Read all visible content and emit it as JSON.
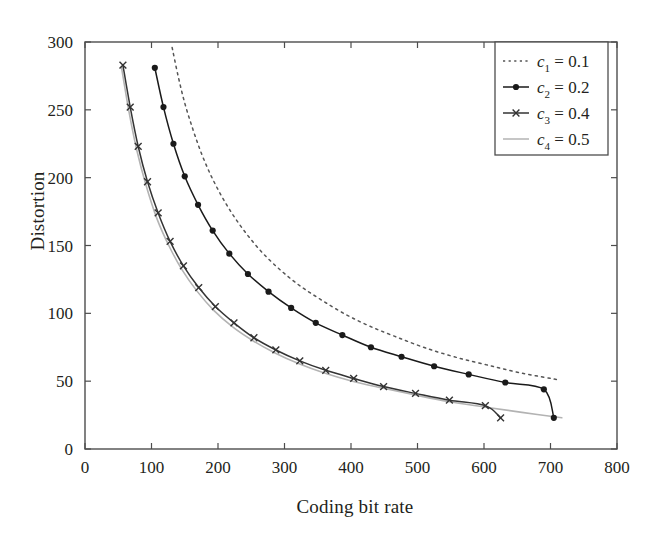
{
  "chart_data": {
    "type": "line",
    "title": "",
    "xlabel": "Coding bit rate",
    "ylabel": "Distortion",
    "xlim": [
      0,
      800
    ],
    "ylim": [
      0,
      300
    ],
    "xticks": [
      0,
      100,
      200,
      300,
      400,
      500,
      600,
      700,
      800
    ],
    "yticks": [
      0,
      50,
      100,
      150,
      200,
      250,
      300
    ],
    "grid": false,
    "legend_position": "top-right",
    "series": [
      {
        "name": "c_1 = 0.1",
        "legend_label": "= 0.1",
        "var_base": "c",
        "var_sub": "1",
        "value": "0.1",
        "style": "dotted",
        "marker": "none",
        "color": "#555555",
        "points": [
          [
            131,
            296
          ],
          [
            140,
            275
          ],
          [
            150,
            255
          ],
          [
            162,
            236
          ],
          [
            175,
            218
          ],
          [
            190,
            201
          ],
          [
            207,
            185
          ],
          [
            226,
            170
          ],
          [
            247,
            156
          ],
          [
            270,
            143
          ],
          [
            296,
            131
          ],
          [
            324,
            120
          ],
          [
            355,
            110
          ],
          [
            389,
            100
          ],
          [
            426,
            91
          ],
          [
            466,
            83
          ],
          [
            509,
            75
          ],
          [
            555,
            68
          ],
          [
            604,
            62
          ],
          [
            656,
            56
          ],
          [
            712,
            51
          ]
        ]
      },
      {
        "name": "c_2 = 0.2",
        "legend_label": "= 0.2",
        "var_base": "c",
        "var_sub": "2",
        "value": "0.2",
        "style": "solid",
        "marker": "circle",
        "color": "#1a1a1a",
        "points": [
          [
            105,
            281
          ],
          [
            118,
            252
          ],
          [
            133,
            225
          ],
          [
            150,
            201
          ],
          [
            170,
            180
          ],
          [
            192,
            161
          ],
          [
            217,
            144
          ],
          [
            245,
            129
          ],
          [
            276,
            116
          ],
          [
            310,
            104
          ],
          [
            347,
            93
          ],
          [
            387,
            84
          ],
          [
            430,
            75
          ],
          [
            476,
            68
          ],
          [
            525,
            61
          ],
          [
            577,
            55
          ],
          [
            632,
            49
          ],
          [
            690,
            44
          ],
          [
            705,
            23
          ]
        ]
      },
      {
        "name": "c_3 = 0.4",
        "legend_label": "= 0.4",
        "var_base": "c",
        "var_sub": "3",
        "value": "0.4",
        "style": "solid",
        "marker": "x",
        "color": "#333333",
        "points": [
          [
            57,
            283
          ],
          [
            68,
            252
          ],
          [
            80,
            223
          ],
          [
            94,
            197
          ],
          [
            110,
            174
          ],
          [
            128,
            153
          ],
          [
            148,
            135
          ],
          [
            171,
            119
          ],
          [
            196,
            105
          ],
          [
            224,
            93
          ],
          [
            254,
            82
          ],
          [
            287,
            73
          ],
          [
            323,
            65
          ],
          [
            362,
            58
          ],
          [
            404,
            52
          ],
          [
            449,
            46
          ],
          [
            497,
            41
          ],
          [
            548,
            36
          ],
          [
            602,
            32
          ],
          [
            625,
            23
          ]
        ]
      },
      {
        "name": "c_4 = 0.5",
        "legend_label": "= 0.5",
        "var_base": "c",
        "var_sub": "4",
        "value": "0.5",
        "style": "solid",
        "marker": "none",
        "color": "#b3b3b3",
        "points": [
          [
            55,
            281
          ],
          [
            66,
            249
          ],
          [
            78,
            220
          ],
          [
            92,
            194
          ],
          [
            108,
            170
          ],
          [
            126,
            150
          ],
          [
            146,
            132
          ],
          [
            169,
            116
          ],
          [
            194,
            102
          ],
          [
            222,
            90
          ],
          [
            252,
            80
          ],
          [
            285,
            71
          ],
          [
            321,
            63
          ],
          [
            360,
            56
          ],
          [
            402,
            50
          ],
          [
            447,
            45
          ],
          [
            495,
            40
          ],
          [
            546,
            35
          ],
          [
            600,
            31
          ],
          [
            657,
            27
          ],
          [
            717,
            23
          ]
        ]
      }
    ]
  },
  "axes": {
    "y_title": "Distortion",
    "x_title": "Coding bit rate"
  }
}
